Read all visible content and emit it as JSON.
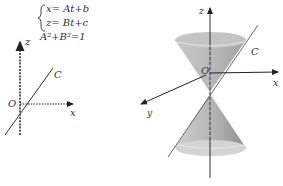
{
  "left_figure": {
    "axis_labels": {
      "z": "z",
      "x": "x",
      "origin": "O"
    },
    "curve_label": "C",
    "equations": {
      "line1": "x= At+b",
      "line2": "z= Bt+c",
      "constraint": "A²+B²=1"
    }
  },
  "right_figure": {
    "axis_labels": {
      "z": "z",
      "x": "x",
      "y": "y",
      "origin": "O"
    },
    "curve_label": "C"
  },
  "colors": {
    "axis": "#222222",
    "cone_fill": "#bdbdbd",
    "cone_dark": "#9a9a9a",
    "cone_rim": "#d9d9d9"
  }
}
